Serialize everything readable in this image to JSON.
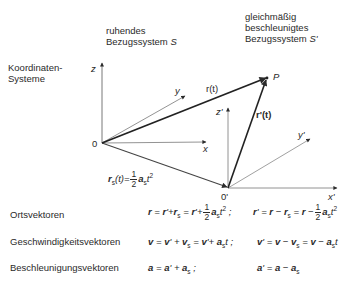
{
  "headers": {
    "rest_frame": [
      "ruhendes",
      "Bezugssystem"
    ],
    "rest_frame_symbol": "S",
    "accel_frame": [
      "gleichmäßig",
      "beschleunigtes",
      "Bezugssystem"
    ],
    "accel_frame_symbol": "S'"
  },
  "section_label": [
    "Koordinaten-",
    "Systeme"
  ],
  "diagram_labels": {
    "z": "z",
    "y": "y",
    "x": "x",
    "origin": "0",
    "z_prime": "z'",
    "y_prime": "y'",
    "x_prime": "x'",
    "origin_prime": "0'",
    "point": "P",
    "r_t": "r(t)",
    "r_prime_t": "r'(t)",
    "rs_formula": "r_s(t) = ½ a_s t²"
  },
  "rows": [
    {
      "label": "Ortsvektoren",
      "formula_left": "r = r' + r_s = r' + ½ a_s t² ;",
      "formula_right": "r' = r − r_s = r − ½ a_s t²"
    },
    {
      "label": "Geschwindigkeitsvektoren",
      "formula_left": "v = v' + v_s = v' + a_s t ;",
      "formula_right": "v' = v − v_s = v − a_s t"
    },
    {
      "label": "Beschleunigungsvektoren",
      "formula_left": "a = a' + a_s ;",
      "formula_right": "a' = a − a_s"
    }
  ]
}
